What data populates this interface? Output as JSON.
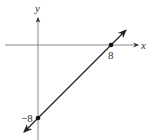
{
  "chart_data": {
    "type": "line",
    "title": "",
    "xlabel": "x",
    "ylabel": "y",
    "xlim": [
      -3.5,
      10.5
    ],
    "ylim": [
      -10,
      3.5
    ],
    "grid": false,
    "series": [
      {
        "name": "line",
        "equation": "y = x - 8",
        "x": [
          -1.5,
          8.5
        ],
        "y": [
          -9.5,
          0.5
        ],
        "points": [
          {
            "x": 8,
            "y": 0,
            "label": "8"
          },
          {
            "x": 0,
            "y": -8,
            "label": "−8"
          }
        ]
      }
    ],
    "colors": {
      "axis": "#888888",
      "line": "#222222",
      "text": "#333333"
    }
  }
}
